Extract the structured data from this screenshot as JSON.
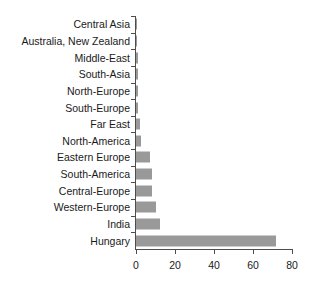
{
  "chart_data": {
    "type": "bar",
    "orientation": "horizontal",
    "title": "",
    "subtitle": "",
    "xlabel": "",
    "ylabel": "",
    "xlim": [
      0,
      80
    ],
    "xticks": [
      0,
      20,
      40,
      60,
      80
    ],
    "xtick_labels": [
      "0",
      "20",
      "40",
      "60",
      "80"
    ],
    "grid": false,
    "legend": null,
    "bar_color": "#999999",
    "axis_color": "#4d4d4d",
    "background_color": "#ffffff",
    "categories": [
      "Central Asia",
      "Australia, New Zealand",
      "Middle-East",
      "South-Asia",
      "North-Europe",
      "South-Europe",
      "Far East",
      "North-America",
      "Eastern Europe",
      "South-America",
      "Central-Europe",
      "Western-Europe",
      "India",
      "Hungary"
    ],
    "values": [
      0.2,
      0.3,
      1,
      1,
      1,
      1,
      2,
      2.5,
      7,
      8,
      8,
      10,
      12.5,
      72
    ]
  }
}
